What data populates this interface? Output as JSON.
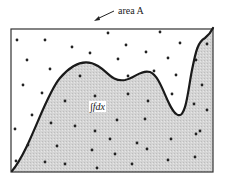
{
  "diagram": {
    "title_label": "area A",
    "integral_label": "∫fdx",
    "colors": {
      "frame": "#333333",
      "curve": "#1a1a1a",
      "shade": "#cfcfcf",
      "dot": "#222222",
      "background": "#ffffff"
    },
    "frame": {
      "x": 11,
      "y": 29,
      "width": 202,
      "height": 143
    },
    "curve_path": "M12,171 C30,150 45,95 60,78 C72,64 85,58 98,66 C108,72 112,82 125,80 C135,78 140,70 150,72 C162,76 168,112 178,115 C186,118 188,90 192,70 C196,50 198,42 205,38 C209,35 211,32 213,28",
    "dots": [
      [
        17,
        40
      ],
      [
        45,
        40
      ],
      [
        72,
        47
      ],
      [
        108,
        33
      ],
      [
        126,
        45
      ],
      [
        146,
        52
      ],
      [
        160,
        32
      ],
      [
        180,
        43
      ],
      [
        207,
        44
      ],
      [
        27,
        60
      ],
      [
        90,
        53
      ],
      [
        118,
        59
      ],
      [
        168,
        58
      ],
      [
        196,
        60
      ],
      [
        50,
        69
      ],
      [
        80,
        76
      ],
      [
        128,
        76
      ],
      [
        154,
        71
      ],
      [
        176,
        75
      ],
      [
        23,
        85
      ],
      [
        42,
        93
      ],
      [
        95,
        96
      ],
      [
        128,
        94
      ],
      [
        172,
        94
      ],
      [
        202,
        85
      ],
      [
        65,
        101
      ],
      [
        148,
        101
      ],
      [
        194,
        104
      ],
      [
        32,
        115
      ],
      [
        117,
        120
      ],
      [
        145,
        119
      ],
      [
        207,
        110
      ],
      [
        15,
        129
      ],
      [
        51,
        123
      ],
      [
        75,
        126
      ],
      [
        95,
        131
      ],
      [
        110,
        139
      ],
      [
        137,
        143
      ],
      [
        171,
        139
      ],
      [
        200,
        131
      ],
      [
        28,
        145
      ],
      [
        57,
        146
      ],
      [
        92,
        150
      ],
      [
        115,
        154
      ],
      [
        147,
        149
      ],
      [
        196,
        134
      ],
      [
        16,
        161
      ],
      [
        45,
        162
      ],
      [
        65,
        164
      ],
      [
        97,
        168
      ],
      [
        132,
        164
      ],
      [
        168,
        160
      ],
      [
        195,
        157
      ]
    ]
  }
}
